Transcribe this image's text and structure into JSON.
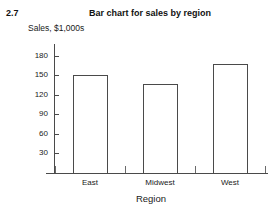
{
  "figure": {
    "number": "2.7",
    "title": "Bar chart for sales by region"
  },
  "chart_data": {
    "type": "bar",
    "title": "Bar chart for sales by region",
    "categories": [
      "East",
      "Midwest",
      "West"
    ],
    "values": [
      150,
      137,
      167
    ],
    "xlabel": "Region",
    "ylabel": "Sales, $1,000s",
    "ylim": [
      0,
      195
    ],
    "yticks": [
      30,
      60,
      90,
      120,
      150,
      180
    ],
    "ytick_labels": [
      "30",
      "60",
      "90",
      "120",
      "150",
      "180"
    ],
    "grid": false,
    "legend": null,
    "bar_style": {
      "fill": "#ffffff",
      "outline": "#4a4a4a"
    }
  }
}
